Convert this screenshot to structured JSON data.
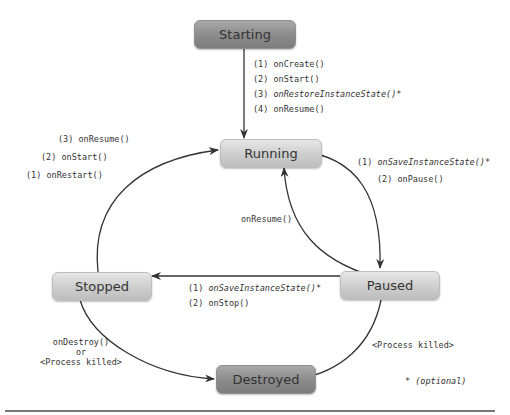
{
  "diagram": {
    "states": {
      "starting": "Starting",
      "running": "Running",
      "paused": "Paused",
      "stopped": "Stopped",
      "destroyed": "Destroyed"
    },
    "transitions": {
      "starting_to_running": [
        "(1) onCreate()",
        "(2) onStart()",
        "(3) ",
        "onRestoreInstanceState()*",
        "(4) onResume()"
      ],
      "stopped_to_running": [
        "(3) onResume()",
        "(2) onStart()",
        "(1) onRestart()"
      ],
      "running_to_paused": [
        "(1) ",
        "onSaveInstanceState()*",
        "(2) onPause()"
      ],
      "paused_to_running": "onResume()",
      "paused_to_stopped": [
        "(1) ",
        "onSaveInstanceState()*",
        "(2) onStop()"
      ],
      "stopped_to_destroyed": [
        "onDestroy()",
        "or",
        "<Process killed>"
      ],
      "paused_to_destroyed": "<Process killed>"
    },
    "footnote": "* (optional)",
    "colors": {
      "dark_state": "#8a8a8a",
      "light_state": "#cdcdcd",
      "arrow": "#333333",
      "text": "#333333"
    }
  }
}
